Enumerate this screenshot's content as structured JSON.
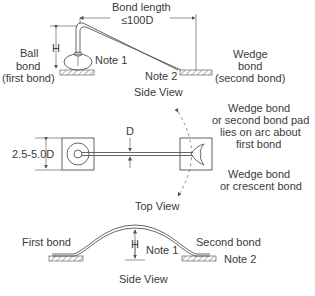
{
  "side_view_1": {
    "bond_length_label": "Bond length",
    "bond_length_value": "≤100D",
    "height_label": "H",
    "note1": "Note 1",
    "note2": "Note 2",
    "ball_bond": [
      "Ball",
      "bond",
      "(first bond)"
    ],
    "wedge_bond": [
      "Wedge",
      "bond",
      "(second bond)"
    ],
    "caption": "Side View"
  },
  "top_view": {
    "pad_size_label": "2.5-5.0D",
    "wire_dia_label": "D",
    "arc_note": [
      "Wedge bond",
      "or second bond pad",
      "lies on arc about",
      "first bond"
    ],
    "wedge_note": [
      "Wedge bond",
      "or crescent bond"
    ],
    "caption": "Top View"
  },
  "side_view_2": {
    "first_bond": "First bond",
    "second_bond": "Second bond",
    "height_label": "H",
    "note1": "Note 1",
    "note2": "Note 2",
    "caption": "Side View"
  }
}
